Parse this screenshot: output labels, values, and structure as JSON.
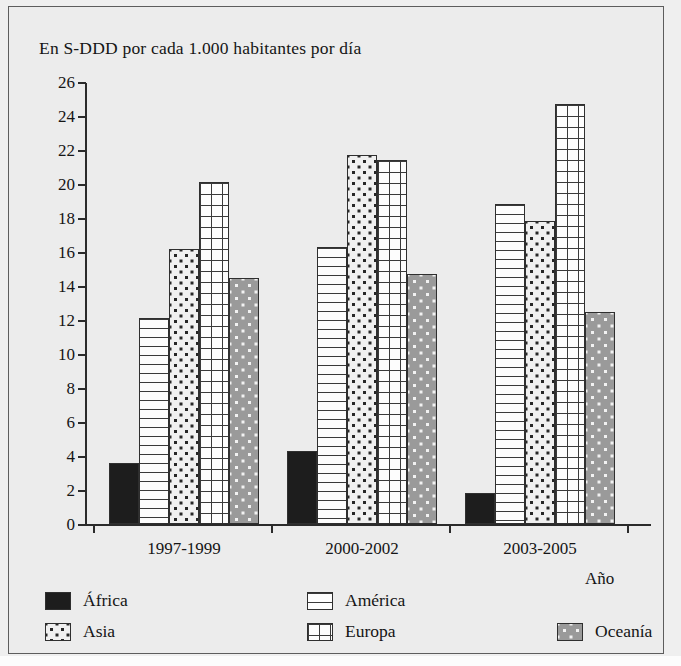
{
  "chart_data": {
    "type": "bar",
    "title": "En S-DDD por cada 1.000 habitantes por día",
    "xlabel": "Año",
    "ylabel": "",
    "categories": [
      "1997-1999",
      "2000-2002",
      "2003-2005"
    ],
    "ylim": [
      0,
      26
    ],
    "ytick_step": 2,
    "yticks": [
      "0",
      "2",
      "4",
      "6",
      "8",
      "10",
      "12",
      "14",
      "16",
      "18",
      "20",
      "22",
      "24",
      "26"
    ],
    "grid": false,
    "legend_position": "bottom",
    "series": [
      {
        "name": "África",
        "values": [
          3.6,
          4.3,
          1.8
        ],
        "pattern": "solid-black",
        "color": "#1d1d1d"
      },
      {
        "name": "América",
        "values": [
          12.1,
          16.3,
          18.8
        ],
        "pattern": "horizontal-lines",
        "color": "#fdfdfd"
      },
      {
        "name": "Asia",
        "values": [
          16.2,
          21.7,
          17.8
        ],
        "pattern": "dots-on-white",
        "color": "#f0f0f0"
      },
      {
        "name": "Europa",
        "values": [
          20.1,
          21.4,
          24.7
        ],
        "pattern": "grid-hatch",
        "color": "#fdfdfd"
      },
      {
        "name": "Oceanía",
        "values": [
          14.5,
          14.7,
          12.5
        ],
        "pattern": "white-dots-on-grey",
        "color": "#9a9a9a"
      }
    ]
  },
  "legend": {
    "entries": [
      {
        "label": "África",
        "swatch": "solid-black"
      },
      {
        "label": "América",
        "swatch": "horizontal-lines"
      },
      {
        "label": "Asia",
        "swatch": "dots-on-white"
      },
      {
        "label": "Europa",
        "swatch": "grid-hatch"
      },
      {
        "label": "Oceanía",
        "swatch": "white-dots-on-grey"
      }
    ]
  }
}
